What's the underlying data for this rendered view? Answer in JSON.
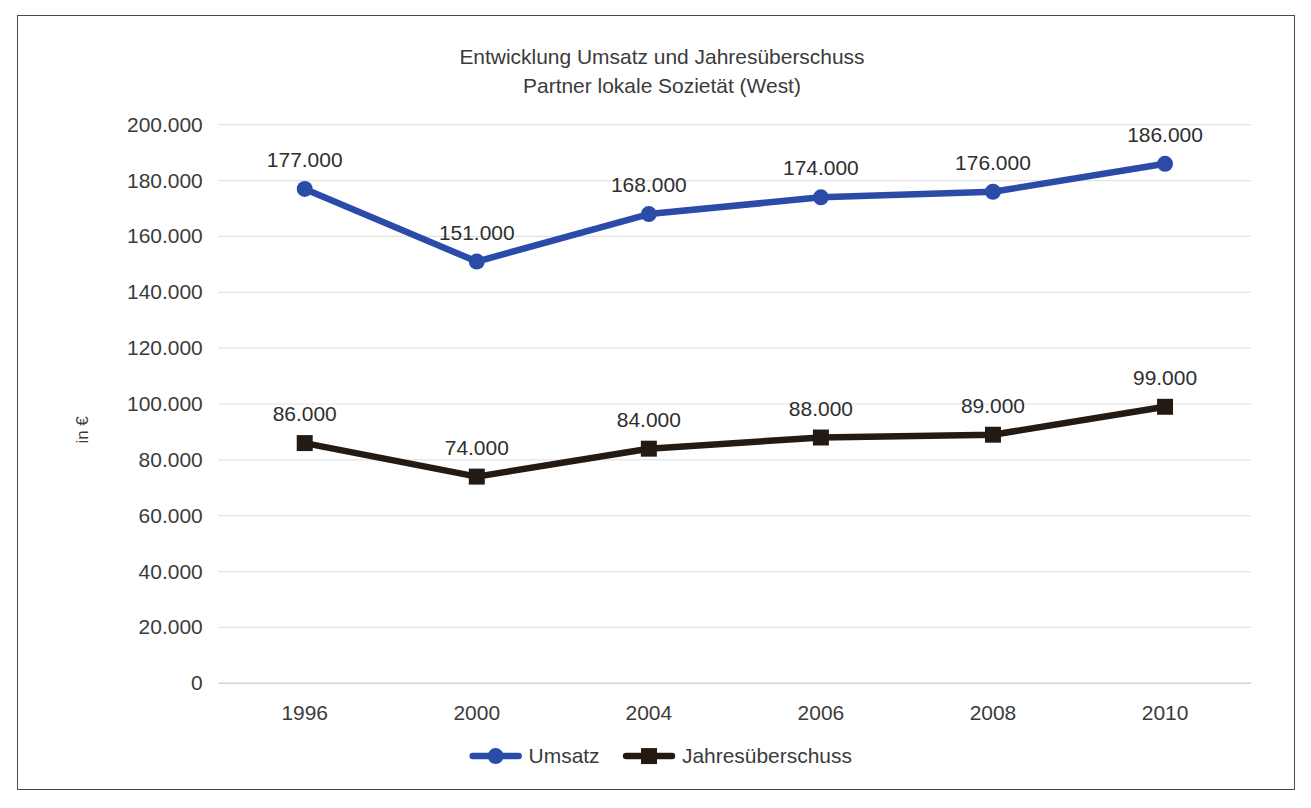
{
  "frame": {
    "border_color": "#4a4a4a",
    "background": "#ffffff"
  },
  "chart_data": {
    "type": "line",
    "title": "Entwicklung Umsatz und Jahresüberschuss",
    "subtitle": "Partner lokale Sozietät (West)",
    "xlabel": "",
    "ylabel": "in €",
    "categories": [
      "1996",
      "2000",
      "2004",
      "2006",
      "2008",
      "2010"
    ],
    "ylim": [
      0,
      200000
    ],
    "ytick_step": 20000,
    "ytick_labels": [
      "0",
      "20.000",
      "40.000",
      "60.000",
      "80.000",
      "100.000",
      "120.000",
      "140.000",
      "160.000",
      "180.000",
      "200.000"
    ],
    "ytick_values": [
      0,
      20000,
      40000,
      60000,
      80000,
      100000,
      120000,
      140000,
      160000,
      180000,
      200000
    ],
    "grid": true,
    "legend_position": "bottom",
    "series": [
      {
        "name": "Umsatz",
        "color": "#2b4ba8",
        "marker": "circle",
        "values": [
          177000,
          151000,
          168000,
          174000,
          176000,
          186000
        ],
        "labels": [
          "177.000",
          "151.000",
          "168.000",
          "174.000",
          "176.000",
          "186.000"
        ],
        "label_positions": [
          "above",
          "above",
          "above",
          "above",
          "above",
          "above"
        ]
      },
      {
        "name": "Jahresüberschuss",
        "color": "#241a14",
        "marker": "square",
        "values": [
          86000,
          74000,
          84000,
          88000,
          89000,
          99000
        ],
        "labels": [
          "86.000",
          "74.000",
          "84.000",
          "88.000",
          "89.000",
          "99.000"
        ],
        "label_positions": [
          "above",
          "above",
          "above",
          "above",
          "above",
          "above"
        ]
      }
    ]
  },
  "legend": {
    "items": [
      {
        "label": "Umsatz",
        "color": "#2b4ba8",
        "marker": "circle"
      },
      {
        "label": "Jahresüberschuss",
        "color": "#241a14",
        "marker": "square"
      }
    ]
  }
}
